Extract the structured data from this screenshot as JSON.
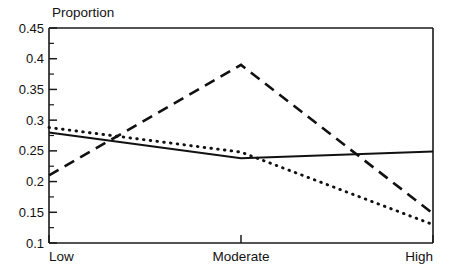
{
  "chart_data": {
    "type": "line",
    "title": "",
    "subtitle": "",
    "xlabel": "",
    "ylabel": "Proportion",
    "categories": [
      "Low",
      "Moderate",
      "High"
    ],
    "x": [
      0,
      1,
      2
    ],
    "xlim": [
      0,
      2
    ],
    "ylim": [
      0.1,
      0.45
    ],
    "grid": false,
    "legend": "none",
    "y_ticks": [
      0.1,
      0.15,
      0.2,
      0.25,
      0.3,
      0.35,
      0.4,
      0.45
    ],
    "y_tick_labels": [
      "0.1",
      "0.15",
      "0.2",
      "0.25",
      "0.3",
      "0.35",
      "0.4",
      "0.45"
    ],
    "y_minor_ticks": [
      0.125,
      0.175,
      0.225,
      0.275,
      0.325,
      0.375,
      0.425
    ],
    "x_tick_labels": [
      "Low",
      "Moderate",
      "High"
    ],
    "series": [
      {
        "name": "series-solid",
        "style": "solid",
        "color": "#111111",
        "values": [
          0.28,
          0.238,
          0.249
        ]
      },
      {
        "name": "series-dashed",
        "style": "dashed",
        "color": "#111111",
        "values": [
          0.21,
          0.39,
          0.148
        ]
      },
      {
        "name": "series-dotted",
        "style": "dotted",
        "color": "#111111",
        "values": [
          0.288,
          0.248,
          0.13
        ]
      }
    ]
  },
  "labels": {
    "y_axis_title": "Proportion"
  },
  "colors": {
    "ink": "#111111",
    "background": "#ffffff"
  }
}
